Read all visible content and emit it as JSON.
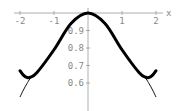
{
  "chart_data": {
    "type": "line",
    "title": "",
    "xlabel": "x",
    "ylabel": "",
    "xlim": [
      -2.05,
      2.1
    ],
    "ylim": [
      0.5,
      1.0
    ],
    "grid": false,
    "legend": null,
    "x_ticks": [
      "-2",
      "-1",
      "1",
      "2"
    ],
    "y_ticks": [
      "0.9",
      "0.8",
      "0.7",
      "0.6"
    ],
    "series": [
      {
        "name": "thick curve",
        "style": "thick",
        "x": [
          -2.0,
          -1.9,
          -1.8,
          -1.7,
          -1.5,
          -1.0,
          -0.5,
          0,
          0.5,
          1.0,
          1.5,
          1.7,
          1.8,
          1.9,
          2.0
        ],
        "y": [
          0.67,
          0.645,
          0.632,
          0.633,
          0.66,
          0.79,
          0.94,
          1.0,
          0.94,
          0.79,
          0.66,
          0.633,
          0.632,
          0.645,
          0.67
        ]
      },
      {
        "name": "thin curve",
        "style": "thin",
        "x": [
          -2.0,
          -1.9,
          -1.8,
          -1.7,
          -1.5,
          -1.0,
          -0.5,
          0,
          0.5,
          1.0,
          1.5,
          1.7,
          1.8,
          1.9,
          2.0
        ],
        "y": [
          0.52,
          0.56,
          0.595,
          0.625,
          0.66,
          0.79,
          0.94,
          1.0,
          0.94,
          0.79,
          0.66,
          0.625,
          0.595,
          0.56,
          0.52
        ]
      }
    ]
  },
  "labels": {
    "x_axis": "x",
    "x_ticks": [
      "-2",
      "-1",
      "1",
      "2"
    ],
    "y_ticks": [
      "0.9",
      "0.8",
      "0.7",
      "0.6"
    ]
  }
}
